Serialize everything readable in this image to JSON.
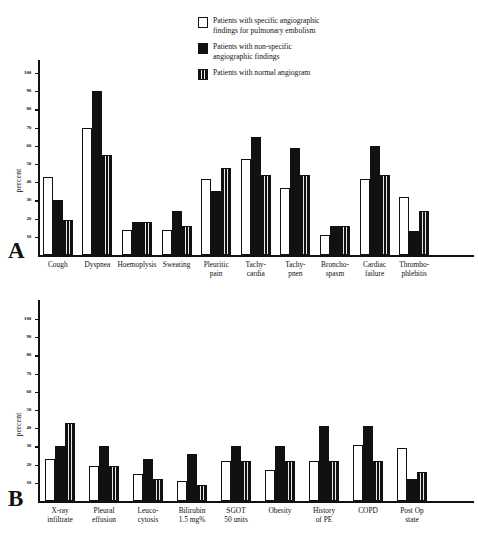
{
  "figure": {
    "ylabel": "percent",
    "panel_a_letter": "A",
    "panel_b_letter": "B"
  },
  "legend": {
    "position": "top-right",
    "items": [
      {
        "swatch": "open",
        "label": "Patients with specific angiographic\nfindings for pulmonary embolism"
      },
      {
        "swatch": "solid",
        "label": "Patients with non-specific\nangiographic findings"
      },
      {
        "swatch": "striped",
        "label": "Patients with normal angiogram"
      }
    ]
  },
  "yticks": [
    "100",
    "90",
    "80",
    "70",
    "60",
    "50",
    "40",
    "30",
    "20",
    "10"
  ],
  "chart_data": [
    {
      "type": "bar",
      "panel": "A",
      "title": "",
      "xlabel": "",
      "ylabel": "percent",
      "ylim": [
        0,
        110
      ],
      "grid": false,
      "categories": [
        "Cough",
        "Dyspnea",
        "Hoemoplysis",
        "Sweating",
        "Pleuritic\npain",
        "Tachy-\ncardia",
        "Tachy-\npnen",
        "Broncho-\nspasm",
        "Cardiac\nfailure",
        "Thrombo-\nphlebitis"
      ],
      "series": [
        {
          "name": "Patients with specific angiographic findings for pulmonary embolism",
          "fill": "open",
          "values": [
            43,
            70,
            14,
            14,
            42,
            53,
            37,
            11,
            42,
            32
          ]
        },
        {
          "name": "Patients with non-specific angiographic findings",
          "fill": "solid",
          "values": [
            30,
            90,
            18,
            24,
            35,
            65,
            59,
            16,
            60,
            13
          ]
        },
        {
          "name": "Patients with normal angiogram",
          "fill": "striped",
          "values": [
            19,
            55,
            18,
            16,
            48,
            44,
            44,
            16,
            44,
            24
          ]
        }
      ]
    },
    {
      "type": "bar",
      "panel": "B",
      "title": "",
      "xlabel": "",
      "ylabel": "percent",
      "ylim": [
        0,
        110
      ],
      "grid": false,
      "categories": [
        "X-ray\ninfiltrate",
        "Pleural\neffusion",
        "Leuco-\ncytosis",
        "Bilirubin\n1.5 mg%",
        "SGOT\n50 units",
        "Obesity",
        "History\nof PE",
        "COPD",
        "Post Op\nstate"
      ],
      "series": [
        {
          "name": "Patients with specific angiographic findings for pulmonary embolism",
          "fill": "open",
          "values": [
            23,
            19,
            15,
            11,
            22,
            17,
            22,
            31,
            29
          ]
        },
        {
          "name": "Patients with non-specific angiographic findings",
          "fill": "solid",
          "values": [
            30,
            30,
            23,
            26,
            30,
            30,
            41,
            41,
            12
          ]
        },
        {
          "name": "Patients with normal angiogram",
          "fill": "striped",
          "values": [
            43,
            19,
            12,
            9,
            22,
            22,
            22,
            22,
            16
          ]
        }
      ]
    }
  ]
}
